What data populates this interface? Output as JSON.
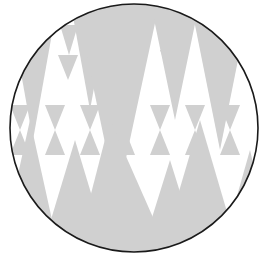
{
  "figure": {
    "shape": "circle",
    "background_color": "#ffffff",
    "fill_color": "#d0d0d0",
    "outline_color": "#1a1a1a",
    "pattern": "triangles",
    "center": [
      134,
      128
    ],
    "radius": 125
  }
}
